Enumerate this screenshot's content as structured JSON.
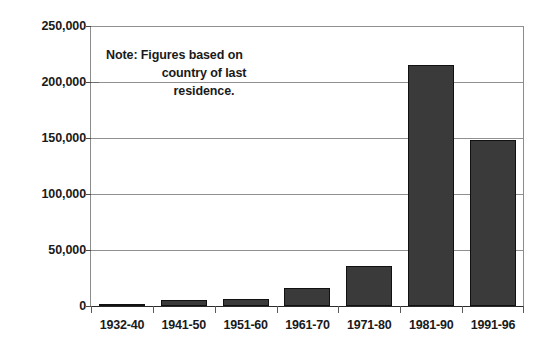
{
  "chart_data": {
    "type": "bar",
    "title": "",
    "subtitle": "",
    "xlabel": "",
    "ylabel": "",
    "categories": [
      "1932-40",
      "1941-50",
      "1951-60",
      "1961-70",
      "1971-80",
      "1981-90",
      "1991-96"
    ],
    "values": [
      1200,
      5500,
      6200,
      16000,
      35500,
      215000,
      148000
    ],
    "ylim": [
      0,
      250000
    ],
    "y_ticks": [
      0,
      50000,
      100000,
      150000,
      200000,
      250000
    ],
    "y_tick_labels": [
      "0",
      "50,000",
      "100,000",
      "150,000",
      "200,000",
      "250,000"
    ],
    "grid": "horizontal",
    "legend": "none",
    "bar_color": "#3a3a3a",
    "bar_border_color": "#111111",
    "gridline_color": "#909090",
    "axis_color": "#2b2b2b",
    "annotations": [
      {
        "name": "note",
        "lines": [
          "Note: Figures based on",
          "country of last",
          "residence."
        ],
        "position": "inside-plot-top-left"
      }
    ]
  },
  "annotation": {
    "line_1": "Note: Figures based on",
    "line_2": "country of last",
    "line_3": "residence."
  },
  "y_axis": {
    "labels": [
      "250,000",
      "200,000",
      "150,000",
      "100,000",
      "50,000",
      "0"
    ]
  },
  "x_axis": {
    "labels": [
      "1932-40",
      "1941-50",
      "1951-60",
      "1961-70",
      "1971-80",
      "1981-90",
      "1991-96"
    ]
  }
}
